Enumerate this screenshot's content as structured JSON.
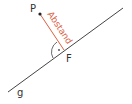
{
  "diagram": {
    "labels": {
      "point": "P",
      "foot": "F",
      "line": "g",
      "distance": "Abstand"
    },
    "colors": {
      "line": "#444444",
      "distance": "#d9603f",
      "text": "#333333"
    },
    "right_angle_marker": "·"
  }
}
